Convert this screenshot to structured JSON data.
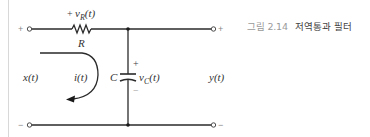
{
  "figure": {
    "caption_number": "그림 2.14",
    "caption_title": "저역통과 필터"
  },
  "circuit": {
    "type": "RC low-pass filter",
    "resistor_voltage_label": "v",
    "resistor_voltage_sub": "R",
    "resistor_voltage_suffix": "(t)",
    "resistor_voltage_plus": "+",
    "resistor_label": "R",
    "capacitor_label": "C",
    "capacitor_voltage_label": "v",
    "capacitor_voltage_sub": "C",
    "capacitor_voltage_suffix": "(t)",
    "capacitor_plus": "+",
    "capacitor_minus": "−",
    "input_label": "x(t)",
    "output_label": "y(t)",
    "current_label": "i(t)",
    "input_plus": "+",
    "input_minus": "−",
    "output_plus": "+",
    "output_minus": "−"
  }
}
